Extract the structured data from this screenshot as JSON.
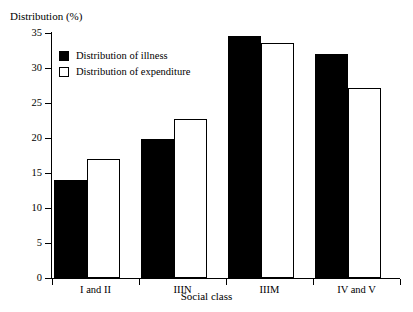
{
  "chart_data": {
    "type": "bar",
    "title": "",
    "xlabel": "Social class",
    "ylabel": "Distribution (%)",
    "categories": [
      "I and II",
      "IIIN",
      "IIIM",
      "IV and V"
    ],
    "series": [
      {
        "name": "Distribution of illness",
        "color": "#000000",
        "style": "filled",
        "values": [
          14.0,
          19.9,
          34.6,
          32.0
        ]
      },
      {
        "name": "Distribution of expenditure",
        "color": "#ffffff",
        "style": "hollow",
        "values": [
          17.0,
          22.7,
          33.6,
          27.2
        ]
      }
    ],
    "ylim": [
      0,
      35
    ],
    "yticks": [
      0,
      5,
      10,
      15,
      20,
      25,
      30,
      35
    ],
    "ytick_labels": [
      "0",
      "5",
      "10",
      "15",
      "20",
      "25",
      "30",
      "35"
    ],
    "grid": false,
    "legend_position": "top-left-inside"
  },
  "axes": {
    "y_title": "Distribution (%)",
    "x_title": "Social class"
  },
  "legend": {
    "entries": [
      {
        "label": "Distribution of illness",
        "swatch": "filled-square-icon"
      },
      {
        "label": "Distribution of expenditure",
        "swatch": "hollow-square-icon"
      }
    ]
  }
}
